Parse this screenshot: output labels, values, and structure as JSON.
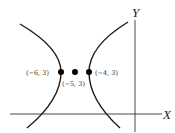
{
  "figure": {
    "type": "hyperbola",
    "axes": {
      "x_label": "X",
      "y_label": "Y"
    },
    "points": [
      {
        "label": "(−6, 3)",
        "x": -6,
        "y": 3,
        "role": "vertex-left"
      },
      {
        "label": "(−5, 3)",
        "x": -5,
        "y": 3,
        "role": "center"
      },
      {
        "label": "(−4, 3)",
        "x": -4,
        "y": 3,
        "role": "vertex-right"
      }
    ],
    "colors": {
      "curve": "#1a1a1a",
      "axis": "#333333",
      "point": "#000000"
    }
  }
}
